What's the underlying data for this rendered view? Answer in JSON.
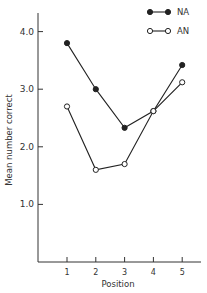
{
  "chart_data": {
    "type": "line",
    "title": "",
    "xlabel": "Position",
    "ylabel": "Mean number correct",
    "x": [
      1,
      2,
      3,
      4,
      5
    ],
    "x_tick_labels": [
      "1",
      "2",
      "3",
      "4",
      "5"
    ],
    "y_ticks": [
      1.0,
      2.0,
      3.0,
      4.0
    ],
    "y_tick_labels": [
      "1.0",
      "2.0",
      "3.0",
      "4.0"
    ],
    "ylim": [
      0,
      4.3
    ],
    "grid": false,
    "legend_position": "top-right",
    "series": [
      {
        "name": "NA",
        "marker": "filled-circle",
        "values": [
          3.8,
          3.0,
          2.33,
          2.62,
          3.42
        ]
      },
      {
        "name": "AN",
        "marker": "open-circle",
        "values": [
          2.7,
          1.6,
          1.7,
          2.62,
          3.12
        ]
      }
    ]
  }
}
